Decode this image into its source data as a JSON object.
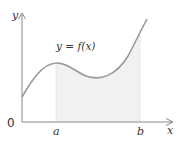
{
  "diagram": {
    "type": "definite-integral-area",
    "curve_label": "y = f(x)",
    "axis_labels": {
      "x": "x",
      "y": "y"
    },
    "origin_label": "0",
    "bounds": {
      "lower": "a",
      "upper": "b"
    },
    "colors": {
      "axis": "#888888",
      "curve": "#999999",
      "shade": "#f1f1f1",
      "bound_lines": "#d6d6d6",
      "text": "#333333"
    }
  }
}
